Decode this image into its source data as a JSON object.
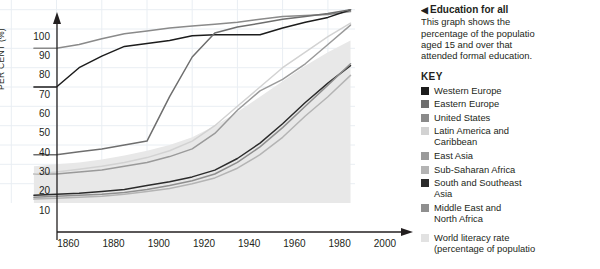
{
  "sidebar": {
    "marker": "◀",
    "title": "Education for all",
    "description_lines": [
      "This graph shows the",
      "percentage of the populatio",
      "aged 15 and over that",
      "attended formal education."
    ],
    "key_title": "KEY",
    "key_items": [
      {
        "label": "Western Europe",
        "label2": "",
        "color": "#1c1c1c"
      },
      {
        "label": "Eastern Europe",
        "label2": "",
        "color": "#6e6e6e"
      },
      {
        "label": "United States",
        "label2": "",
        "color": "#8a8a8a"
      },
      {
        "label": "Latin America and",
        "label2": "Caribbean",
        "color": "#d2d2d2"
      },
      {
        "label": "East Asia",
        "label2": "",
        "color": "#9a9a9a"
      },
      {
        "label": "Sub-Saharan Africa",
        "label2": "",
        "color": "#b4b4b4"
      },
      {
        "label": "South and Southeast",
        "label2": "Asia",
        "color": "#2b2b2b"
      },
      {
        "label": "Middle East and",
        "label2": "North Africa",
        "color": "#8f8f8f"
      },
      {
        "label": "World literacy rate",
        "label2": "(percentage of populatio",
        "color": "#e2e2e2"
      }
    ]
  },
  "chart_data": {
    "type": "line",
    "title": "Education for all",
    "xlabel": "",
    "ylabel": "PER CENT (%)",
    "xlim": [
      1855,
      2012
    ],
    "ylim": [
      0,
      105
    ],
    "xticks": [
      1860,
      1880,
      1900,
      1920,
      1940,
      1960,
      1980,
      2000
    ],
    "yticks": [
      10,
      20,
      30,
      40,
      50,
      60,
      70,
      80,
      90,
      100
    ],
    "grid": true,
    "legend_position": "right",
    "x": [
      1870,
      1880,
      1890,
      1900,
      1910,
      1920,
      1930,
      1940,
      1950,
      1960,
      1970,
      1980,
      1990,
      2000,
      2010
    ],
    "series": [
      {
        "name": "United States",
        "color": "#8a8a8a",
        "values": [
          80,
          80,
          82,
          85,
          87.5,
          89,
          90.5,
          91.5,
          92.5,
          93.5,
          95,
          96.5,
          97,
          97.5,
          99
        ]
      },
      {
        "name": "Western Europe",
        "color": "#1c1c1c",
        "values": [
          60,
          60,
          70,
          76,
          81,
          82.5,
          84,
          86.5,
          87,
          87,
          87,
          90.5,
          93.5,
          96,
          100
        ]
      },
      {
        "name": "Eastern Europe",
        "color": "#6e6e6e",
        "values": [
          25,
          25,
          26.5,
          28,
          30,
          32,
          55,
          75.5,
          88,
          91,
          93,
          95,
          96.5,
          98,
          100
        ]
      },
      {
        "name": "East Asia",
        "color": "#9a9a9a",
        "values": [
          15,
          15,
          16,
          17,
          19,
          21,
          24,
          28,
          36,
          48,
          58,
          64,
          72,
          82,
          92
        ]
      },
      {
        "name": "Latin America and Caribbean",
        "color": "#d2d2d2",
        "values": [
          15,
          16,
          17.5,
          19,
          21,
          23.5,
          27,
          32,
          40,
          50,
          60,
          70,
          78,
          86,
          93
        ]
      },
      {
        "name": "South and Southeast Asia",
        "color": "#2b2b2b",
        "values": [
          4,
          4.5,
          5,
          6,
          7,
          9,
          11,
          13.5,
          17,
          23,
          31,
          41,
          52,
          62,
          71
        ]
      },
      {
        "name": "Middle East and North Africa",
        "color": "#8f8f8f",
        "values": [
          3,
          3.5,
          4,
          4.5,
          5.5,
          7,
          9,
          11.5,
          15,
          21,
          29,
          39,
          50,
          61,
          72
        ]
      },
      {
        "name": "Sub-Saharan Africa",
        "color": "#b4b4b4",
        "values": [
          2,
          2.5,
          3,
          3.5,
          4.5,
          6,
          7.5,
          10,
          13,
          18,
          25,
          34,
          45,
          55,
          66
        ]
      }
    ],
    "area": {
      "name": "World literacy rate",
      "color": "#e8e8e8",
      "x": [
        1870,
        1880,
        1890,
        1900,
        1910,
        1920,
        1930,
        1940,
        1950,
        1960,
        1970,
        1980,
        1990,
        2000,
        2010
      ],
      "upper": [
        19,
        20,
        21,
        22.5,
        24.5,
        27,
        30,
        34,
        40,
        47,
        55,
        63,
        71,
        78,
        84
      ],
      "lower": [
        0,
        0,
        0,
        0,
        0,
        0,
        0,
        0,
        0,
        0,
        0,
        0,
        0,
        0,
        0
      ]
    }
  }
}
